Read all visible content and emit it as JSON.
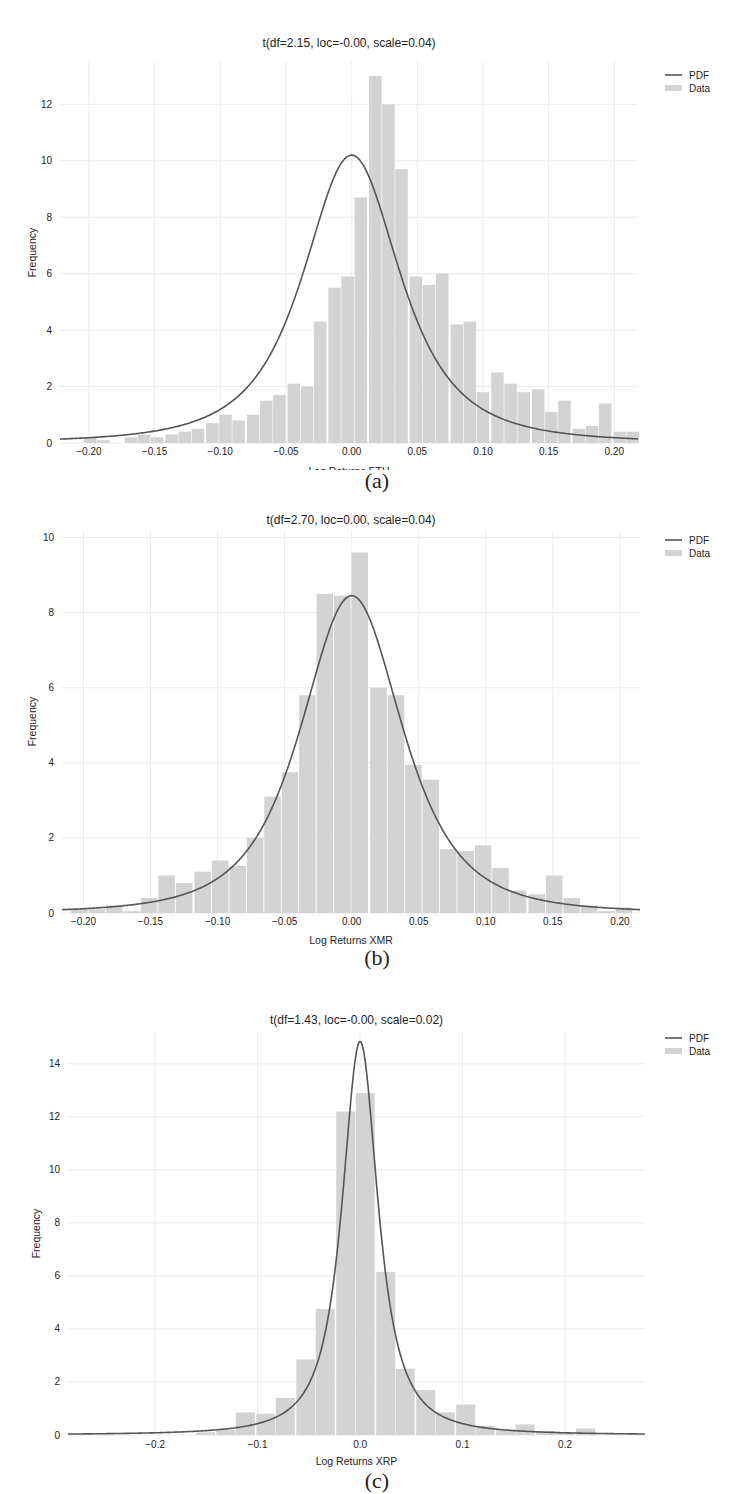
{
  "figure": {
    "panels": [
      {
        "id": "a",
        "caption": "(a)",
        "title": "t(df=2.15, loc=-0.00, scale=0.04)",
        "xlabel": "Log Returns ETH",
        "ylabel": "Frequency"
      },
      {
        "id": "b",
        "caption": "(b)",
        "title": "t(df=2.70, loc=0.00, scale=0.04)",
        "xlabel": "Log Returns XMR",
        "ylabel": "Frequency"
      },
      {
        "id": "c",
        "caption": "(c)",
        "title": "t(df=1.43, loc=-0.00, scale=0.02)",
        "xlabel": "Log Returns XRP",
        "ylabel": "Frequency"
      }
    ],
    "legend": {
      "pdf_label": "PDF",
      "data_label": "Data"
    },
    "colors": {
      "bar": "#d3d3d3",
      "pdf_line": "#555555",
      "grid": "#ececec",
      "text": "#222222"
    }
  },
  "chart_data": [
    {
      "type": "bar",
      "subtype": "histogram_with_pdf",
      "title": "t(df=2.15, loc=-0.00, scale=0.04)",
      "xlabel": "Log Returns ETH",
      "ylabel": "Frequency",
      "xlim": [
        -0.222,
        0.218
      ],
      "ylim": [
        0,
        13.5
      ],
      "xticks": [
        -0.2,
        -0.15,
        -0.1,
        -0.05,
        0.0,
        0.05,
        0.1,
        0.15,
        0.2
      ],
      "xtick_labels": [
        "-0.20",
        "-0.15",
        "-0.10",
        "-0.05",
        "0.00",
        "0.05",
        "0.10",
        "0.15",
        "0.20"
      ],
      "yticks": [
        0,
        2,
        4,
        6,
        8,
        10,
        12
      ],
      "grid": true,
      "legend": [
        "PDF",
        "Data"
      ],
      "legend_position": "upper right, outside",
      "pdf": {
        "dist": "t",
        "df": 2.15,
        "loc": 0.0,
        "scale": 0.04,
        "peak": 10.2
      },
      "bin_width": 0.0103,
      "bins": [
        {
          "x": -0.199,
          "h": 0.2
        },
        {
          "x": -0.189,
          "h": 0.1
        },
        {
          "x": -0.168,
          "h": 0.2
        },
        {
          "x": -0.158,
          "h": 0.3
        },
        {
          "x": -0.148,
          "h": 0.2
        },
        {
          "x": -0.137,
          "h": 0.3
        },
        {
          "x": -0.127,
          "h": 0.4
        },
        {
          "x": -0.117,
          "h": 0.5
        },
        {
          "x": -0.106,
          "h": 0.7
        },
        {
          "x": -0.096,
          "h": 1.0
        },
        {
          "x": -0.086,
          "h": 0.8
        },
        {
          "x": -0.075,
          "h": 1.0
        },
        {
          "x": -0.065,
          "h": 1.5
        },
        {
          "x": -0.055,
          "h": 1.7
        },
        {
          "x": -0.044,
          "h": 2.1
        },
        {
          "x": -0.034,
          "h": 2.0
        },
        {
          "x": -0.024,
          "h": 4.3
        },
        {
          "x": -0.013,
          "h": 5.5
        },
        {
          "x": -0.003,
          "h": 5.9
        },
        {
          "x": 0.007,
          "h": 8.7
        },
        {
          "x": 0.018,
          "h": 13.0
        },
        {
          "x": 0.028,
          "h": 12.0
        },
        {
          "x": 0.038,
          "h": 9.7
        },
        {
          "x": 0.049,
          "h": 5.9
        },
        {
          "x": 0.059,
          "h": 5.6
        },
        {
          "x": 0.069,
          "h": 6.0
        },
        {
          "x": 0.08,
          "h": 4.2
        },
        {
          "x": 0.09,
          "h": 4.3
        },
        {
          "x": 0.1,
          "h": 1.8
        },
        {
          "x": 0.111,
          "h": 2.5
        },
        {
          "x": 0.121,
          "h": 2.1
        },
        {
          "x": 0.131,
          "h": 1.8
        },
        {
          "x": 0.142,
          "h": 1.9
        },
        {
          "x": 0.152,
          "h": 1.1
        },
        {
          "x": 0.162,
          "h": 1.5
        },
        {
          "x": 0.173,
          "h": 0.5
        },
        {
          "x": 0.183,
          "h": 0.6
        },
        {
          "x": 0.193,
          "h": 1.4
        },
        {
          "x": 0.204,
          "h": 0.4
        },
        {
          "x": 0.214,
          "h": 0.4
        }
      ]
    },
    {
      "type": "bar",
      "subtype": "histogram_with_pdf",
      "title": "t(df=2.70, loc=0.00, scale=0.04)",
      "xlabel": "Log Returns XMR",
      "ylabel": "Frequency",
      "xlim": [
        -0.216,
        0.215
      ],
      "ylim": [
        0,
        10.2
      ],
      "xticks": [
        -0.2,
        -0.15,
        -0.1,
        -0.05,
        0.0,
        0.05,
        0.1,
        0.15,
        0.2
      ],
      "xtick_labels": [
        "-0.20",
        "-0.15",
        "-0.10",
        "-0.05",
        "0.00",
        "0.05",
        "0.10",
        "0.15",
        "0.20"
      ],
      "yticks": [
        0,
        2,
        4,
        6,
        8,
        10
      ],
      "grid": true,
      "legend": [
        "PDF",
        "Data"
      ],
      "legend_position": "upper right, outside",
      "pdf": {
        "dist": "t",
        "df": 2.7,
        "loc": 0.0,
        "scale": 0.04,
        "peak": 8.45
      },
      "bin_width": 0.0131,
      "bins": [
        {
          "x": -0.203,
          "h": 0.1
        },
        {
          "x": -0.19,
          "h": 0.1
        },
        {
          "x": -0.177,
          "h": 0.2
        },
        {
          "x": -0.164,
          "h": 0.05
        },
        {
          "x": -0.151,
          "h": 0.4
        },
        {
          "x": -0.138,
          "h": 1.0
        },
        {
          "x": -0.125,
          "h": 0.8
        },
        {
          "x": -0.111,
          "h": 1.1
        },
        {
          "x": -0.098,
          "h": 1.4
        },
        {
          "x": -0.085,
          "h": 1.25
        },
        {
          "x": -0.072,
          "h": 2.0
        },
        {
          "x": -0.059,
          "h": 3.1
        },
        {
          "x": -0.046,
          "h": 3.75
        },
        {
          "x": -0.033,
          "h": 5.8
        },
        {
          "x": -0.02,
          "h": 8.5
        },
        {
          "x": -0.007,
          "h": 8.45
        },
        {
          "x": 0.006,
          "h": 9.6
        },
        {
          "x": 0.02,
          "h": 6.0
        },
        {
          "x": 0.033,
          "h": 5.8
        },
        {
          "x": 0.046,
          "h": 3.95
        },
        {
          "x": 0.059,
          "h": 3.55
        },
        {
          "x": 0.072,
          "h": 1.7
        },
        {
          "x": 0.085,
          "h": 1.65
        },
        {
          "x": 0.098,
          "h": 1.8
        },
        {
          "x": 0.111,
          "h": 1.2
        },
        {
          "x": 0.124,
          "h": 0.6
        },
        {
          "x": 0.138,
          "h": 0.5
        },
        {
          "x": 0.151,
          "h": 1.0
        },
        {
          "x": 0.164,
          "h": 0.4
        },
        {
          "x": 0.177,
          "h": 0.2
        },
        {
          "x": 0.19,
          "h": 0.05
        },
        {
          "x": 0.203,
          "h": 0.15
        }
      ]
    },
    {
      "type": "bar",
      "subtype": "histogram_with_pdf",
      "title": "t(df=1.43, loc=-0.00, scale=0.02)",
      "xlabel": "Log Returns XRP",
      "ylabel": "Frequency",
      "xlim": [
        -0.285,
        0.278
      ],
      "ylim": [
        0,
        15.2
      ],
      "xticks": [
        -0.2,
        -0.1,
        0.0,
        0.1,
        0.2
      ],
      "xtick_labels": [
        "-0.2",
        "-0.1",
        "0.0",
        "0.1",
        "0.2"
      ],
      "yticks": [
        0,
        2,
        4,
        6,
        8,
        10,
        12,
        14
      ],
      "grid": true,
      "legend": [
        "PDF",
        "Data"
      ],
      "legend_position": "upper right, outside",
      "pdf": {
        "dist": "t",
        "df": 1.43,
        "loc": 0.0,
        "scale": 0.02,
        "peak": 14.85
      },
      "bin_width": 0.0195,
      "bins": [
        {
          "x": -0.151,
          "h": 0.1
        },
        {
          "x": -0.131,
          "h": 0.2
        },
        {
          "x": -0.112,
          "h": 0.85
        },
        {
          "x": -0.092,
          "h": 0.8
        },
        {
          "x": -0.073,
          "h": 1.4
        },
        {
          "x": -0.053,
          "h": 2.85
        },
        {
          "x": -0.034,
          "h": 4.75
        },
        {
          "x": -0.014,
          "h": 12.2
        },
        {
          "x": 0.005,
          "h": 12.9
        },
        {
          "x": 0.025,
          "h": 6.15
        },
        {
          "x": 0.044,
          "h": 2.5
        },
        {
          "x": 0.064,
          "h": 1.7
        },
        {
          "x": 0.083,
          "h": 0.85
        },
        {
          "x": 0.103,
          "h": 1.15
        },
        {
          "x": 0.122,
          "h": 0.35
        },
        {
          "x": 0.142,
          "h": 0.2
        },
        {
          "x": 0.161,
          "h": 0.4
        },
        {
          "x": 0.181,
          "h": 0.15
        },
        {
          "x": 0.2,
          "h": 0.1
        },
        {
          "x": 0.22,
          "h": 0.25
        }
      ]
    }
  ]
}
